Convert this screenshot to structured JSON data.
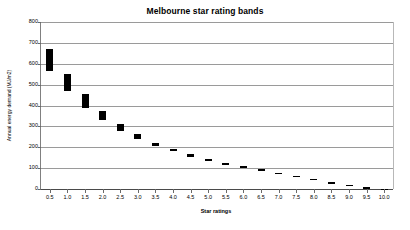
{
  "chart_data": {
    "type": "bar",
    "title": "Melbourne star rating bands",
    "xlabel": "Star ratings",
    "ylabel": "Annual energy demand (MJ/m2)",
    "grid": true,
    "legend": "none",
    "ylim": [
      0,
      800
    ],
    "yticks": [
      0,
      100,
      200,
      300,
      400,
      500,
      600,
      700,
      800
    ],
    "ytick_labels": [
      "0",
      "100",
      "200",
      "300",
      "400",
      "500",
      "600",
      "700",
      "800"
    ],
    "categories": [
      "0.5",
      "1.0",
      "1.5",
      "2.0",
      "2.5",
      "3.0",
      "3.5",
      "4.0",
      "4.5",
      "5.0",
      "5.5",
      "6.0",
      "6.5",
      "7.0",
      "7.5",
      "8.0",
      "8.5",
      "9.0",
      "9.5",
      "10.0"
    ],
    "series": [
      {
        "name": "Energy demand band",
        "kind": "range-band",
        "low": [
          565,
          470,
          390,
          330,
          280,
          238,
          205,
          180,
          155,
          133,
          114,
          99,
          86,
          70,
          56,
          41,
          26,
          12,
          3,
          0
        ],
        "high": [
          670,
          550,
          455,
          375,
          310,
          262,
          222,
          192,
          166,
          143,
          124,
          108,
          94,
          79,
          64,
          49,
          33,
          19,
          8,
          2
        ]
      }
    ],
    "colors": {
      "bar": "#000000",
      "grid": "#9a9a9a",
      "axis": "#4a4a4a",
      "text": "#000000",
      "background": "#ffffff"
    }
  }
}
